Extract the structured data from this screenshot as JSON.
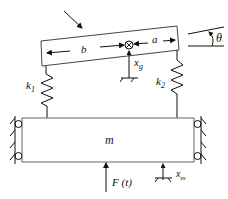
{
  "diagram": {
    "type": "mechanical-vibration-model",
    "labels": {
      "mass": "m",
      "beam_length_left": "b",
      "beam_length_right": "a",
      "angle": "θ",
      "beam_displacement": "x",
      "beam_displacement_sub": "g",
      "spring_left": "k",
      "spring_left_sub": "1",
      "spring_right": "k",
      "spring_right_sub": "2",
      "force": "F (t)",
      "mass_displacement": "x",
      "mass_displacement_sub": "m"
    },
    "colors": {
      "stroke": "#1a1a1a",
      "body_stroke": "#555555",
      "background": "#ffffff"
    }
  }
}
